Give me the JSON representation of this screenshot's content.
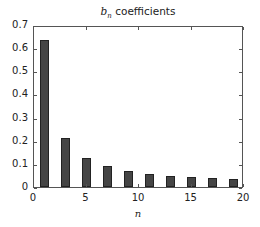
{
  "chart_data": {
    "type": "bar",
    "title_parts": {
      "symbol": "b",
      "subscript": "n",
      "rest": " coefficients"
    },
    "xlabel": "n",
    "ylabel": "",
    "x": [
      1,
      3,
      5,
      7,
      9,
      11,
      13,
      15,
      17,
      19
    ],
    "values": [
      0.637,
      0.212,
      0.127,
      0.091,
      0.071,
      0.058,
      0.049,
      0.042,
      0.037,
      0.034
    ],
    "xlim": [
      0,
      20
    ],
    "ylim": [
      0,
      0.7
    ],
    "xticks": [
      "0",
      "5",
      "10",
      "15",
      "20"
    ],
    "yticks": [
      "0",
      "0.1",
      "0.2",
      "0.3",
      "0.4",
      "0.5",
      "0.6",
      "0.7"
    ],
    "grid": false,
    "legend": null,
    "bar_color": "#454545"
  }
}
